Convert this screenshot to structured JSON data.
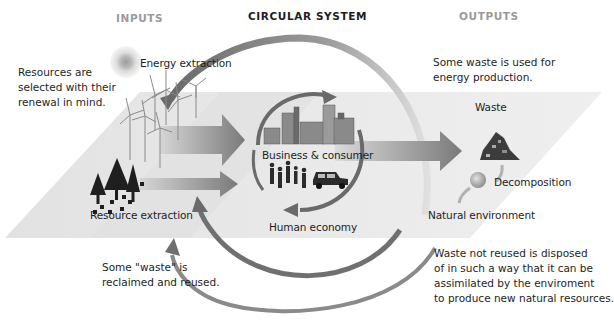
{
  "headers": {
    "inputs": "INPUTS",
    "circular_system": "CIRCULAR SYSTEM",
    "outputs": "OUTPUTS"
  },
  "labels": {
    "energy_extraction": "Energy extraction",
    "resource_extraction": "Resource extraction",
    "business_consumer": "Business & consumer",
    "human_economy": "Human economy",
    "waste": "Waste",
    "decomposition": "Decomposition",
    "natural_environment": "Natural environment"
  },
  "notes": {
    "resources_selected": [
      "Resources are",
      "selected with their",
      "renewal in mind."
    ],
    "waste_energy": [
      "Some waste is used for",
      "energy production."
    ],
    "waste_reclaimed": [
      "Some \"waste\" is",
      "reclaimed and reused."
    ],
    "waste_disposed": [
      "Waste not reused is disposed",
      "of in such a way that it can be",
      "assimilated by the enviroment",
      "to produce new natural resources."
    ]
  },
  "colors": {
    "plane": "#e6e6e6",
    "arrow_dark": "#6f6f6f",
    "arrow_light": "#c8c8c8",
    "header_grey": "#9a9a9a",
    "text": "#1e1e1e"
  }
}
